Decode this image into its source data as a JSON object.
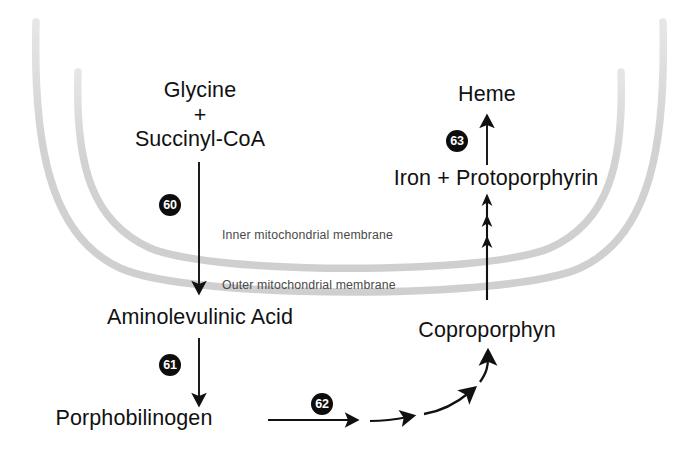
{
  "diagram": {
    "background_color": "#ffffff",
    "text_color": "#111111",
    "membrane_color": "#d8d8d8",
    "badge_color": "#0d0d0d",
    "badge_text_color": "#ffffff"
  },
  "metabolites": {
    "glycine": "Glycine",
    "plus": "+",
    "succinyl_coa": "Succinyl-CoA",
    "aminolevulinic_acid": "Aminolevulinic Acid",
    "porphobilinogen": "Porphobilinogen",
    "coproporphyn": "Coproporphyn",
    "iron_protoporphyrin": "Iron + Protoporphyrin",
    "heme": "Heme"
  },
  "membranes": {
    "inner": "Inner mitochondrial membrane",
    "outer": "Outer mitochondrial membrane"
  },
  "steps": {
    "step_60": "60",
    "step_61": "61",
    "step_62": "62",
    "step_63": "63"
  },
  "arrows": {
    "glycine_to_ala": "arrow-down-glycine-to-aminolevulinic-acid",
    "ala_to_pbg": "arrow-down-aminolevulinic-acid-to-porphobilinogen",
    "pbg_to_copro": "arrow-curved-porphobilinogen-to-coproporphyn",
    "copro_to_iron": "arrow-up-triple-coproporphyn-to-iron-protoporphyrin",
    "iron_to_heme": "arrow-up-iron-protoporphyrin-to-heme"
  }
}
